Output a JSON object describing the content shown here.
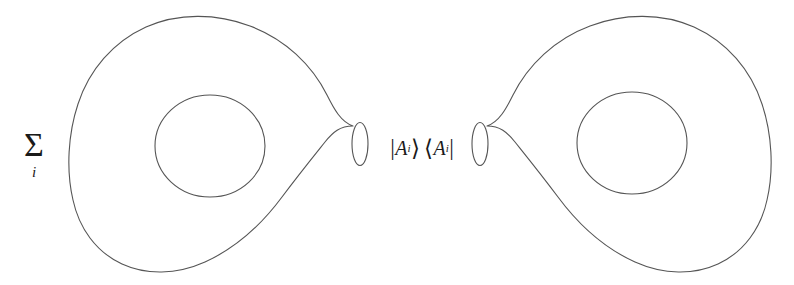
{
  "figure": {
    "kind": "torus-factorization-diagram",
    "background_color": "#ffffff",
    "stroke_color": "#555555",
    "text_color": "#1a1a1a",
    "width": 794,
    "height": 285
  },
  "sum": {
    "sigma": "Σ",
    "index": "i"
  },
  "operator": {
    "ket_open": "|",
    "ket_symbol": "A",
    "ket_index": "i",
    "ket_close": "⟩",
    "bra_open": "⟨",
    "bra_symbol": "A",
    "bra_index": "i",
    "bra_close": "|",
    "full_text": "|Aᵢ⟩⟨Aⁱ|"
  },
  "shapes": {
    "left_surface_label": "genus-one surface (left)",
    "right_surface_label": "genus-one surface (right)",
    "left_hole_label": "handle hole (left)",
    "right_hole_label": "handle hole (right)",
    "left_boundary_label": "left neck boundary circle",
    "right_boundary_label": "right neck boundary circle"
  }
}
